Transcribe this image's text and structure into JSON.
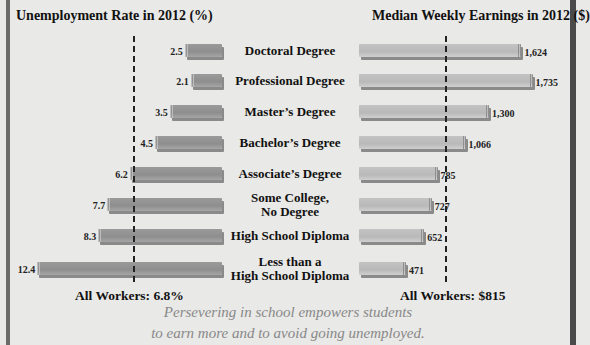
{
  "chart_data": {
    "type": "bar",
    "orientation": "horizontal-butterfly",
    "categories": [
      "Doctoral Degree",
      "Professional Degree",
      "Master's Degree",
      "Bachelor's Degree",
      "Associate's Degree",
      "Some College, No Degree",
      "High School Diploma",
      "Less than a High School Diploma"
    ],
    "series": [
      {
        "name": "Unemployment Rate in 2012 (%)",
        "values": [
          2.5,
          2.1,
          3.5,
          4.5,
          6.2,
          7.7,
          8.3,
          12.4
        ],
        "labels": [
          "2.5",
          "2.1",
          "3.5",
          "4.5",
          "6.2",
          "7.7",
          "8.3",
          "12.4"
        ],
        "reference": {
          "label": "All Workers: 6.8%",
          "value": 6.8
        }
      },
      {
        "name": "Median Weekly Earnings in 2012 ($)",
        "values": [
          1624,
          1735,
          1300,
          1066,
          785,
          727,
          652,
          471
        ],
        "labels": [
          "1,624",
          "1,735",
          "1,300",
          "1,066",
          "785",
          "727",
          "652",
          "471"
        ],
        "reference": {
          "label": "All Workers: $815",
          "value": 815
        }
      }
    ],
    "title_left": "Unemployment Rate in 2012 (%)",
    "title_right": "Median Weekly Earnings in 2012 ($)",
    "caption": "Persevering in school empowers students to earn more and to avoid going unemployed.",
    "grid": false,
    "legend": "none"
  },
  "titles": {
    "left": "Unemployment Rate in 2012 (%)",
    "right": "Median Weekly Earnings in 2012 ($)"
  },
  "categories": [
    {
      "line1": "Doctoral Degree",
      "line2": ""
    },
    {
      "line1": "Professional Degree",
      "line2": ""
    },
    {
      "line1": "Master’s Degree",
      "line2": ""
    },
    {
      "line1": "Bachelor’s Degree",
      "line2": ""
    },
    {
      "line1": "Associate’s Degree",
      "line2": ""
    },
    {
      "line1": "Some College,",
      "line2": "No Degree"
    },
    {
      "line1": "High School Diploma",
      "line2": ""
    },
    {
      "line1": "Less than a",
      "line2": "High School Diploma"
    }
  ],
  "left_labels": [
    "2.5",
    "2.1",
    "3.5",
    "4.5",
    "6.2",
    "7.7",
    "8.3",
    "12.4"
  ],
  "right_labels": [
    "1,624",
    "1,735",
    "1,300",
    "1,066",
    "785",
    "727",
    "652",
    "471"
  ],
  "all_workers": {
    "left": "All Workers: 6.8%",
    "right": "All Workers: $815"
  },
  "caption": {
    "line1": "Persevering in school empowers students",
    "line2": "to earn more and to avoid going unemployed."
  },
  "colors": {
    "left_bar": "#939393",
    "right_bar": "#bdbdbd",
    "background": "#e9e9e7"
  }
}
